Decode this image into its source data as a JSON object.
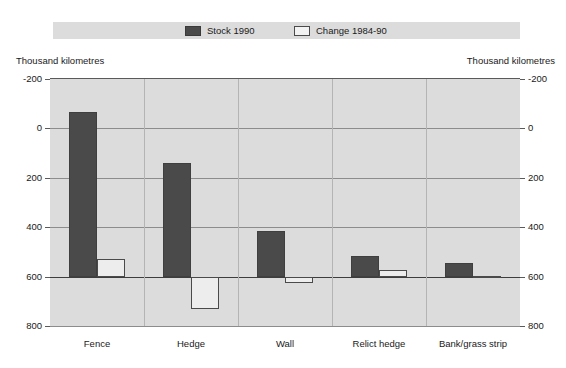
{
  "legend": {
    "entries": [
      {
        "label": "Stock 1990",
        "color": "#4a4a4a",
        "style": "filled"
      },
      {
        "label": "Change 1984-90",
        "color": "#ededed",
        "style": "outline"
      }
    ]
  },
  "axis": {
    "left_caption": "Thousand kilometres",
    "right_caption": "Thousand kilometres",
    "ticks": [
      "800",
      "600",
      "400",
      "200",
      "0",
      "-200"
    ]
  },
  "colors": {
    "stock_bar": "#4a4a4a",
    "change_bar": "#ededed",
    "plot_background": "#dcdcdc",
    "page_background": "#ffffff",
    "gridline": "#8c8c8c",
    "zero_line": "#3d3d3d"
  },
  "chart_data": {
    "type": "bar",
    "title": "",
    "subtitle": "",
    "xlabel": "",
    "ylabel": "Thousand kilometres",
    "ylim": [
      -200,
      800
    ],
    "yticks": [
      -200,
      0,
      200,
      400,
      600,
      800
    ],
    "grid": true,
    "legend_position": "top",
    "categories": [
      "Fence",
      "Hedge",
      "Wall",
      "Relict hedge",
      "Bank/grass strip"
    ],
    "series": [
      {
        "name": "Stock 1990",
        "values": [
          665,
          458,
          185,
          85,
          55
        ]
      },
      {
        "name": "Change 1984-90",
        "values": [
          70,
          -130,
          -25,
          25,
          3
        ]
      }
    ]
  }
}
